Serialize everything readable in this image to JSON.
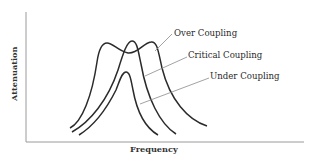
{
  "diagram": {
    "title": "",
    "x_axis_label": "Frequency",
    "y_axis_label": "Attenuation",
    "curves": [
      {
        "name": "over-coupling",
        "label": "Over Coupling",
        "shape": "double-peaked"
      },
      {
        "name": "critical-coupling",
        "label": "Critical Coupling",
        "shape": "single sharp peak"
      },
      {
        "name": "under-coupling",
        "label": "Under Coupling",
        "shape": "single lower peak"
      }
    ],
    "colors": {
      "line": "#2b2b2b",
      "axis": "#9a9a9a",
      "leader": "#8a8a8a",
      "background": "#ffffff"
    }
  }
}
